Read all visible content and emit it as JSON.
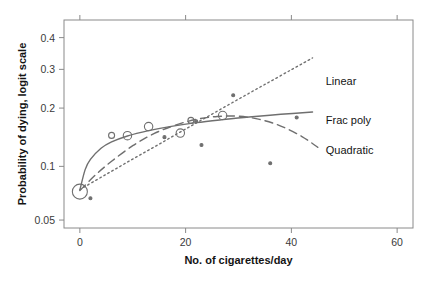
{
  "figure": {
    "name": "probability-of-dying-vs-cigarettes",
    "background": "#ffffff",
    "frame_color": "#8a8a8a",
    "ink_color": "#6f6f6f",
    "text_color": "#141414"
  },
  "chart_data": {
    "type": "scatter",
    "title": "",
    "xlabel": "No. of cigarettes/day",
    "ylabel": "Probability of dying, logit scale",
    "xlim": [
      -3,
      63
    ],
    "ylim": [
      0.045,
      0.46
    ],
    "yscale": "logit",
    "grid": false,
    "legend_position": "inline-annotations",
    "xticks": [
      0,
      20,
      40,
      60
    ],
    "xticklabels": [
      "0",
      "20",
      "40",
      "60"
    ],
    "yticks": [
      0.05,
      0.1,
      0.2,
      0.3,
      0.4
    ],
    "yticklabels": [
      "0.05",
      "0.1",
      "0.2",
      "0.3",
      "0.4"
    ],
    "points": [
      {
        "x": 0,
        "y": 0.0725,
        "size": "large",
        "filled": false
      },
      {
        "x": 2,
        "y": 0.0665,
        "size": "tiny",
        "filled": true
      },
      {
        "x": 6,
        "y": 0.146,
        "size": "small",
        "filled": false
      },
      {
        "x": 9,
        "y": 0.1455,
        "size": "medium",
        "filled": false
      },
      {
        "x": 13,
        "y": 0.162,
        "size": "medium",
        "filled": false
      },
      {
        "x": 16,
        "y": 0.143,
        "size": "tiny",
        "filled": true
      },
      {
        "x": 19,
        "y": 0.15,
        "size": "medium",
        "filled": false
      },
      {
        "x": 21,
        "y": 0.174,
        "size": "small",
        "filled": false
      },
      {
        "x": 22,
        "y": 0.172,
        "size": "tiny",
        "filled": true
      },
      {
        "x": 23,
        "y": 0.13,
        "size": "tiny",
        "filled": true
      },
      {
        "x": 27,
        "y": 0.184,
        "size": "medium",
        "filled": false
      },
      {
        "x": 29,
        "y": 0.23,
        "size": "tiny",
        "filled": true
      },
      {
        "x": 36,
        "y": 0.104,
        "size": "tiny",
        "filled": true
      },
      {
        "x": 41,
        "y": 0.18,
        "size": "tiny",
        "filled": true
      }
    ],
    "series": [
      {
        "name": "Linear",
        "label": "Linear",
        "style": "dotted",
        "label_x": 46.5,
        "label_y": 0.268,
        "curve": [
          {
            "x": 0,
            "y": 0.0745
          },
          {
            "x": 5,
            "y": 0.0905
          },
          {
            "x": 10,
            "y": 0.1095
          },
          {
            "x": 15,
            "y": 0.1315
          },
          {
            "x": 20,
            "y": 0.1575
          },
          {
            "x": 25,
            "y": 0.187
          },
          {
            "x": 30,
            "y": 0.2205
          },
          {
            "x": 35,
            "y": 0.258
          },
          {
            "x": 40,
            "y": 0.299
          },
          {
            "x": 44,
            "y": 0.3345
          }
        ]
      },
      {
        "name": "Frac poly",
        "label": "Frac poly",
        "style": "solid",
        "label_x": 46.5,
        "label_y": 0.174,
        "curve": [
          {
            "x": 0,
            "y": 0.074
          },
          {
            "x": 1,
            "y": 0.096
          },
          {
            "x": 2,
            "y": 0.109
          },
          {
            "x": 4,
            "y": 0.125
          },
          {
            "x": 6,
            "y": 0.135
          },
          {
            "x": 9,
            "y": 0.145
          },
          {
            "x": 13,
            "y": 0.1545
          },
          {
            "x": 17,
            "y": 0.162
          },
          {
            "x": 22,
            "y": 0.1695
          },
          {
            "x": 27,
            "y": 0.1755
          },
          {
            "x": 32,
            "y": 0.181
          },
          {
            "x": 38,
            "y": 0.1865
          },
          {
            "x": 44,
            "y": 0.1915
          }
        ]
      },
      {
        "name": "Quadratic",
        "label": "Quadratic",
        "style": "dashed",
        "label_x": 46.5,
        "label_y": 0.123,
        "curve": [
          {
            "x": 0,
            "y": 0.0735
          },
          {
            "x": 3,
            "y": 0.09
          },
          {
            "x": 6,
            "y": 0.1065
          },
          {
            "x": 10,
            "y": 0.129
          },
          {
            "x": 14,
            "y": 0.149
          },
          {
            "x": 18,
            "y": 0.1645
          },
          {
            "x": 22,
            "y": 0.176
          },
          {
            "x": 26,
            "y": 0.182
          },
          {
            "x": 30,
            "y": 0.1825
          },
          {
            "x": 34,
            "y": 0.176
          },
          {
            "x": 38,
            "y": 0.163
          },
          {
            "x": 42,
            "y": 0.144
          },
          {
            "x": 45,
            "y": 0.1265
          }
        ]
      }
    ]
  }
}
